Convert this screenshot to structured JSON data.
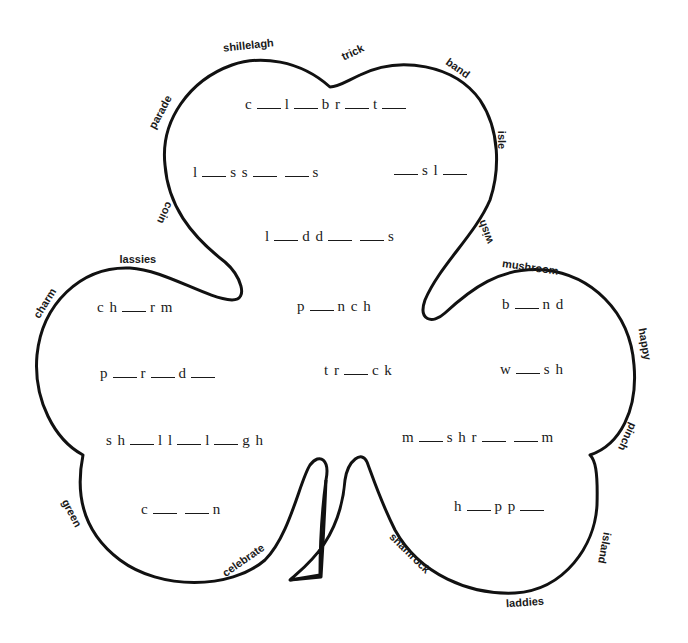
{
  "worksheet": {
    "stroke_color": "#111111",
    "background": "#ffffff",
    "border_words": [
      {
        "id": "shillelagh",
        "text": "shillelagh",
        "x": 248,
        "y": 45,
        "rotate": -6
      },
      {
        "id": "trick",
        "text": "trick",
        "x": 352,
        "y": 52,
        "rotate": -25
      },
      {
        "id": "band",
        "text": "band",
        "x": 458,
        "y": 68,
        "rotate": 35
      },
      {
        "id": "parade",
        "text": "parade",
        "x": 160,
        "y": 112,
        "rotate": -62
      },
      {
        "id": "isle",
        "text": "isle",
        "x": 502,
        "y": 140,
        "rotate": 90
      },
      {
        "id": "coin",
        "text": "coin",
        "x": 165,
        "y": 213,
        "rotate": 115
      },
      {
        "id": "wish",
        "text": "wish",
        "x": 485,
        "y": 232,
        "rotate": -110
      },
      {
        "id": "lassies",
        "text": "lassies",
        "x": 138,
        "y": 259,
        "rotate": 0
      },
      {
        "id": "mushroom",
        "text": "mushroom",
        "x": 530,
        "y": 267,
        "rotate": 8
      },
      {
        "id": "charm",
        "text": "charm",
        "x": 44,
        "y": 303,
        "rotate": -58
      },
      {
        "id": "happy",
        "text": "happy",
        "x": 645,
        "y": 344,
        "rotate": 80
      },
      {
        "id": "pinch",
        "text": "pinch",
        "x": 627,
        "y": 437,
        "rotate": 115
      },
      {
        "id": "green",
        "text": "green",
        "x": 72,
        "y": 513,
        "rotate": 62
      },
      {
        "id": "celebrate",
        "text": "celebrate",
        "x": 243,
        "y": 560,
        "rotate": -35
      },
      {
        "id": "shamrock",
        "text": "shamrock",
        "x": 410,
        "y": 553,
        "rotate": 45
      },
      {
        "id": "island",
        "text": "island",
        "x": 605,
        "y": 548,
        "rotate": 100
      },
      {
        "id": "laddies",
        "text": "laddies",
        "x": 525,
        "y": 602,
        "rotate": -4
      }
    ],
    "puzzles": [
      {
        "id": "celebrate",
        "parts": [
          "c",
          "_",
          "l",
          "_",
          "b r",
          "_",
          "t",
          "_"
        ],
        "x": 245,
        "y": 104
      },
      {
        "id": "lassies",
        "parts": [
          "l",
          "_",
          "s s",
          "_",
          "_",
          "s"
        ],
        "x": 193,
        "y": 172
      },
      {
        "id": "isle",
        "parts": [
          "_",
          "s l",
          "_"
        ],
        "x": 390,
        "y": 170
      },
      {
        "id": "laddies",
        "parts": [
          "l",
          "_",
          "d d",
          "_",
          "_",
          "s"
        ],
        "x": 265,
        "y": 236
      },
      {
        "id": "charm",
        "parts": [
          "c h",
          "_",
          "r m"
        ],
        "x": 97,
        "y": 307
      },
      {
        "id": "pinch",
        "parts": [
          "p",
          "_",
          "n c h"
        ],
        "x": 297,
        "y": 306
      },
      {
        "id": "band",
        "parts": [
          "b",
          "_",
          "n d"
        ],
        "x": 502,
        "y": 304
      },
      {
        "id": "parade",
        "parts": [
          "p",
          "_",
          "r",
          "_",
          "d",
          "_"
        ],
        "x": 100,
        "y": 373
      },
      {
        "id": "trick",
        "parts": [
          "t r",
          "_",
          "c k"
        ],
        "x": 324,
        "y": 370
      },
      {
        "id": "wish",
        "parts": [
          "w",
          "_",
          "s h"
        ],
        "x": 500,
        "y": 369
      },
      {
        "id": "shillelagh",
        "parts": [
          "s h",
          "_",
          "l l",
          "_",
          "l",
          "_",
          "g h"
        ],
        "x": 106,
        "y": 440
      },
      {
        "id": "mushroom",
        "parts": [
          "m",
          "_",
          "s h r",
          "_",
          "_",
          "m"
        ],
        "x": 402,
        "y": 437
      },
      {
        "id": "coin",
        "parts": [
          "c",
          "_",
          "_",
          "n"
        ],
        "x": 141,
        "y": 509
      },
      {
        "id": "happy",
        "parts": [
          "h",
          "_",
          "p p",
          "_"
        ],
        "x": 454,
        "y": 506
      }
    ]
  }
}
